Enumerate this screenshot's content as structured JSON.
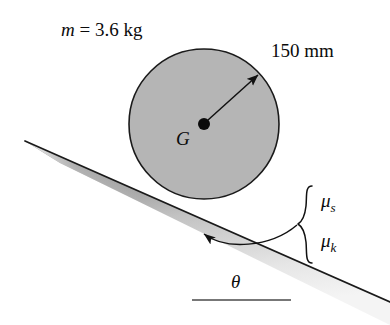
{
  "figure": {
    "background_color": "#ffffff",
    "line_color": "#111111",
    "disk_fill_color": "#b5b5b5"
  },
  "labels": {
    "mass_prefix": "m",
    "mass_equals": " = 3.6 kg",
    "radius": "150 mm",
    "center": "G",
    "angle": "θ",
    "mu_static_symbol": "μ",
    "mu_static_subscript": "s",
    "mu_kinetic_symbol": "μ",
    "mu_kinetic_subscript": "k"
  },
  "geometry": {
    "disk_center_x": 204,
    "disk_center_y": 124,
    "disk_radius": 75,
    "incline_start_x": 25,
    "incline_start_y": 141,
    "incline_end_x": 390,
    "incline_end_y": 302,
    "incline_angle_deg": 24,
    "radius_arrow_angle_deg": 42,
    "horizontal_ref_line_x1": 192,
    "horizontal_ref_line_x2": 291,
    "horizontal_ref_line_y": 300
  }
}
